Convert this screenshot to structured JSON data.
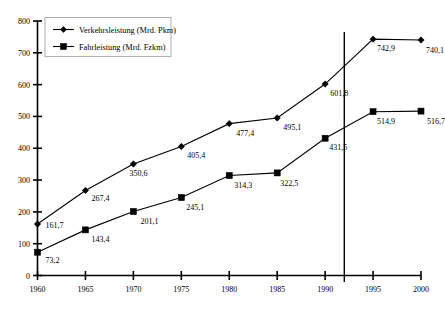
{
  "chart_data": {
    "type": "line",
    "title": "",
    "xlabel": "",
    "ylabel": "",
    "x": [
      1960,
      1965,
      1970,
      1975,
      1980,
      1985,
      1990,
      1995,
      2000
    ],
    "categories": [
      "1960",
      "1965",
      "1970",
      "1975",
      "1980",
      "1985",
      "1990",
      "1995",
      "2000"
    ],
    "xlim": [
      1960,
      2000
    ],
    "ylim": [
      0,
      800
    ],
    "yticks": [
      0,
      100,
      200,
      300,
      400,
      500,
      600,
      700,
      800
    ],
    "ytick_labels": [
      "0",
      "100",
      "200",
      "300",
      "400",
      "500",
      "600",
      "700",
      "800"
    ],
    "grid": false,
    "legend_position": "top-left",
    "series": [
      {
        "name": "Verkehrsleistung (Mrd. Pkm)",
        "marker": "diamond",
        "values": [
          161.7,
          267.4,
          350.6,
          405.4,
          477.4,
          495.1,
          601.8,
          742.9,
          740.1
        ],
        "labels": [
          "161,7",
          "267,4",
          "350,6",
          "405,4",
          "477,4",
          "495,1",
          "601,8",
          "742,9",
          "740,1"
        ]
      },
      {
        "name": "Fahrleistung (Mrd. Fzkm)",
        "marker": "square",
        "values": [
          73.2,
          143.4,
          201.1,
          245.1,
          314.3,
          322.5,
          431.5,
          514.9,
          516.7
        ],
        "labels": [
          "73,2",
          "143,4",
          "201,1",
          "245,1",
          "314,3",
          "322,5",
          "431,5",
          "514,9",
          "516,7"
        ]
      }
    ],
    "annotations": [
      {
        "name": "reunification-marker",
        "type": "vertical-line",
        "x": 1992,
        "label": ""
      }
    ],
    "colors": {
      "line": "#000000",
      "marker": "#000000",
      "axis": "#000000",
      "background": "#ffffff"
    }
  }
}
